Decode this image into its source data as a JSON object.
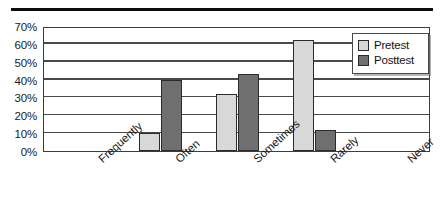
{
  "chart_data": {
    "type": "bar",
    "title": "",
    "xlabel": "",
    "ylabel": "",
    "categories": [
      "Frequently",
      "Often",
      "Sometimes",
      "Rarely",
      "Never"
    ],
    "series": [
      {
        "name": "Pretest",
        "color": "#d8d8d8",
        "values": [
          0,
          10,
          32,
          62,
          0
        ]
      },
      {
        "name": "Posttest",
        "color": "#6f6f6f",
        "values": [
          0,
          40,
          43,
          12,
          0
        ]
      }
    ],
    "ylim": [
      0,
      70
    ],
    "y_ticks": [
      0,
      10,
      20,
      30,
      40,
      50,
      60,
      70
    ],
    "y_tick_labels": [
      "0%",
      "10%",
      "20%",
      "30%",
      "40%",
      "50%",
      "60%",
      "70%"
    ],
    "grid": true,
    "legend_position": "top-right"
  },
  "legend": {
    "items": [
      {
        "label": "Pretest"
      },
      {
        "label": "Posttest"
      }
    ]
  }
}
